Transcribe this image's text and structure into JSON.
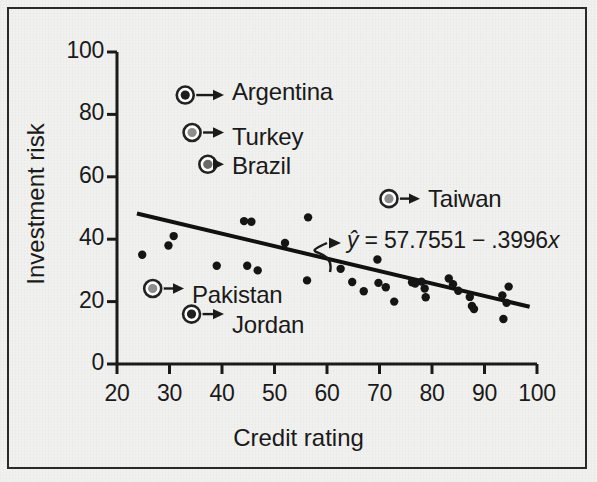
{
  "figure": {
    "background_color": "#f1f1ef",
    "frame_color": "#2a2a2a",
    "ink_color": "#1a1a1a"
  },
  "chart_data": {
    "type": "scatter",
    "title": "",
    "xlabel": "Credit rating",
    "ylabel": "Investment risk",
    "xlim": [
      20,
      100
    ],
    "ylim": [
      0,
      100
    ],
    "xticks": [
      20,
      30,
      40,
      50,
      60,
      70,
      80,
      90,
      100
    ],
    "yticks": [
      0,
      20,
      40,
      60,
      80,
      100
    ],
    "xtick_labels": [
      "20",
      "30",
      "40",
      "50",
      "60",
      "70",
      "80",
      "90",
      "100"
    ],
    "ytick_labels": [
      "0",
      "20",
      "40",
      "60",
      "80",
      "100"
    ],
    "grid": false,
    "legend": "none",
    "point_color": "#151515",
    "point_radius": 4.2,
    "points": [
      {
        "x": 24.8,
        "y": 35.0
      },
      {
        "x": 29.8,
        "y": 38.0
      },
      {
        "x": 30.8,
        "y": 41.0
      },
      {
        "x": 39.0,
        "y": 31.5
      },
      {
        "x": 44.2,
        "y": 45.8
      },
      {
        "x": 45.6,
        "y": 45.6
      },
      {
        "x": 44.8,
        "y": 31.5
      },
      {
        "x": 46.8,
        "y": 30.0
      },
      {
        "x": 52.0,
        "y": 38.8
      },
      {
        "x": 56.4,
        "y": 47.0
      },
      {
        "x": 56.2,
        "y": 26.8
      },
      {
        "x": 62.6,
        "y": 30.5
      },
      {
        "x": 64.8,
        "y": 26.3
      },
      {
        "x": 67.0,
        "y": 23.3
      },
      {
        "x": 69.6,
        "y": 33.5
      },
      {
        "x": 69.8,
        "y": 26.0
      },
      {
        "x": 71.2,
        "y": 24.6
      },
      {
        "x": 72.8,
        "y": 20.0
      },
      {
        "x": 76.2,
        "y": 26.2
      },
      {
        "x": 76.8,
        "y": 25.8
      },
      {
        "x": 78.0,
        "y": 26.4
      },
      {
        "x": 78.6,
        "y": 24.2
      },
      {
        "x": 78.8,
        "y": 21.4
      },
      {
        "x": 83.2,
        "y": 27.4
      },
      {
        "x": 84.0,
        "y": 25.6
      },
      {
        "x": 85.0,
        "y": 23.5
      },
      {
        "x": 87.2,
        "y": 21.5
      },
      {
        "x": 87.6,
        "y": 18.6
      },
      {
        "x": 88.0,
        "y": 17.6
      },
      {
        "x": 93.4,
        "y": 22.0
      },
      {
        "x": 94.6,
        "y": 24.8
      },
      {
        "x": 94.2,
        "y": 19.6
      },
      {
        "x": 93.6,
        "y": 14.4
      }
    ],
    "regression": {
      "equation_display": "ŷ = 57.7551 − .3996x",
      "intercept": 57.7551,
      "slope": -0.3996,
      "x_start": 23.8,
      "x_end": 98.6,
      "color": "#111111",
      "line_width": 4
    },
    "annotations": [
      {
        "label": "Argentina",
        "marker_x": 33.0,
        "marker_y": 86.2,
        "fill": "#1f1f1f",
        "ring": "#222222",
        "label_left": 232,
        "label_top": 78
      },
      {
        "label": "Turkey",
        "marker_x": 34.3,
        "marker_y": 74.2,
        "fill": "#8d8d8d",
        "ring": "#222222",
        "label_left": 232,
        "label_top": 123
      },
      {
        "label": "Brazil",
        "marker_x": 37.3,
        "marker_y": 64.0,
        "fill": "#6a6a6a",
        "ring": "#222222",
        "label_left": 232,
        "label_top": 152
      },
      {
        "label": "Taiwan",
        "marker_x": 71.8,
        "marker_y": 53.0,
        "fill": "#8d8d8d",
        "ring": "#222222",
        "label_left": 428,
        "label_top": 185
      },
      {
        "label": "Pakistan",
        "marker_x": 26.8,
        "marker_y": 24.2,
        "fill": "#8d8d8d",
        "ring": "#222222",
        "label_left": 192,
        "label_top": 281
      },
      {
        "label": "Jordan",
        "marker_x": 34.2,
        "marker_y": 16.0,
        "fill": "#1f1f1f",
        "ring": "#222222",
        "label_left": 232,
        "label_top": 311
      }
    ],
    "equation_label": {
      "left": 347,
      "top": 227
    }
  }
}
